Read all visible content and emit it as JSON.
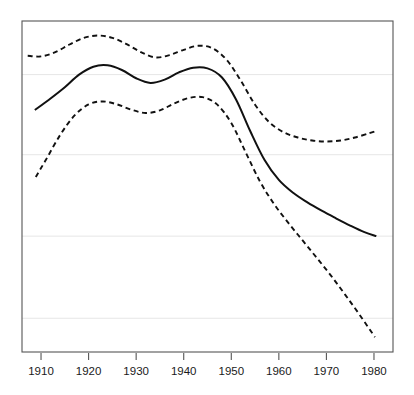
{
  "chart_data": {
    "type": "line",
    "title": "",
    "subtitle": "",
    "xlabel": "",
    "ylabel": "",
    "grid": true,
    "legend": "none",
    "xlim": [
      1906,
      1984
    ],
    "ylim": [
      0,
      1
    ],
    "xticks": [
      1910,
      1920,
      1930,
      1940,
      1950,
      1960,
      1970,
      1980
    ],
    "xtick_labels": [
      "1910",
      "1920",
      "1930",
      "1940",
      "1950",
      "1960",
      "1970",
      "1980"
    ],
    "yticks": [],
    "ytick_labels": [],
    "gridline_y_values": [
      0.838,
      0.596,
      0.35,
      0.102
    ],
    "series": [
      {
        "name": "fitted trend",
        "style": "solid",
        "color": "#111111",
        "x": [
          1908.7,
          1912,
          1915,
          1918,
          1921,
          1924,
          1927,
          1930,
          1933,
          1936,
          1939,
          1942,
          1945,
          1948,
          1951,
          1954,
          1957,
          1960,
          1963,
          1966,
          1969,
          1972,
          1975,
          1978,
          1980.5
        ],
        "y": [
          0.731,
          0.766,
          0.8,
          0.838,
          0.862,
          0.866,
          0.852,
          0.827,
          0.813,
          0.823,
          0.845,
          0.859,
          0.857,
          0.83,
          0.763,
          0.667,
          0.58,
          0.52,
          0.481,
          0.452,
          0.427,
          0.404,
          0.382,
          0.362,
          0.35
        ]
      },
      {
        "name": "upper confidence bound",
        "style": "dashed",
        "color": "#111111",
        "x": [
          1907.2,
          1910,
          1913,
          1916,
          1919,
          1922,
          1925,
          1928,
          1931,
          1934,
          1937,
          1940,
          1943,
          1946,
          1949,
          1952,
          1955,
          1958,
          1961,
          1964,
          1967,
          1970,
          1973,
          1976,
          1979,
          1980.5
        ],
        "y": [
          0.895,
          0.893,
          0.906,
          0.929,
          0.949,
          0.956,
          0.949,
          0.93,
          0.906,
          0.89,
          0.897,
          0.913,
          0.925,
          0.918,
          0.883,
          0.82,
          0.747,
          0.694,
          0.664,
          0.648,
          0.639,
          0.636,
          0.639,
          0.648,
          0.661,
          0.668
        ]
      },
      {
        "name": "lower confidence bound",
        "style": "dashed",
        "color": "#111111",
        "x": [
          1908.9,
          1911,
          1914,
          1917,
          1920,
          1923,
          1926,
          1929,
          1932,
          1935,
          1938,
          1941,
          1944,
          1947,
          1950,
          1953,
          1956,
          1959,
          1962,
          1965,
          1968,
          1971,
          1974,
          1977,
          1980.2
        ],
        "y": [
          0.529,
          0.58,
          0.655,
          0.714,
          0.748,
          0.757,
          0.748,
          0.732,
          0.722,
          0.73,
          0.751,
          0.767,
          0.77,
          0.748,
          0.692,
          0.604,
          0.516,
          0.447,
          0.39,
          0.337,
          0.284,
          0.23,
          0.172,
          0.112,
          0.045
        ]
      }
    ]
  },
  "axis": {
    "frame_color": "#555555",
    "grid_color": "#e6e6e6",
    "tick_color": "#555555",
    "background": "#ffffff"
  }
}
